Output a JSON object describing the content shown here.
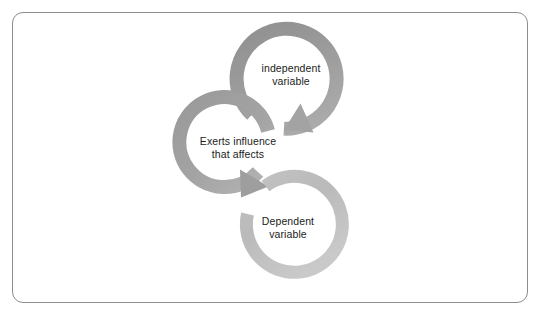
{
  "figure": {
    "background_color": "#ffffff",
    "frame": {
      "border_color": "#8d8d8f",
      "corner_radius": "11px"
    }
  },
  "diagram": {
    "type": "cycle-arrow-diagram",
    "node_count": 3,
    "nodes": [
      {
        "id": "independent-variable",
        "label": "independent\nvariable",
        "ring_color": "#9b9b9b",
        "position": "top",
        "gap_side": "left",
        "arrow_direction": "down-left"
      },
      {
        "id": "exerts-influence",
        "label": "Exerts influence\nthat affects",
        "ring_color": "#a0a0a0",
        "position": "middle",
        "gap_side": "right",
        "arrow_direction": "down-right"
      },
      {
        "id": "dependent-variable",
        "label": "Dependent\nvariable",
        "ring_color": "#bcbcbc",
        "position": "bottom",
        "gap_side": "upper-left",
        "arrow_direction": "none"
      }
    ],
    "flow": [
      {
        "from": "independent-variable",
        "to": "exerts-influence"
      },
      {
        "from": "exerts-influence",
        "to": "dependent-variable"
      }
    ],
    "label_color": "#1b1b1b"
  }
}
